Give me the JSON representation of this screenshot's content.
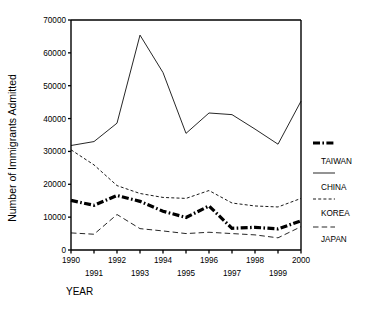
{
  "figure": {
    "clipped_title": "",
    "background": "#ffffff",
    "ink_color": "#000000"
  },
  "axis_x_title": "YEAR",
  "axis_y_title": "Number of Immigrants Admitted",
  "legend": {
    "entries": [
      {
        "label": "TAIWAN",
        "style": "thick-dash-dot",
        "series": "KOREA"
      },
      {
        "label": "CHINA",
        "style": "thin-solid",
        "series": "TAIWAN"
      },
      {
        "label": "KOREA",
        "style": "fine-dotted",
        "series": "CHINA"
      },
      {
        "label": "JAPAN",
        "style": "long-dashed",
        "series": "JAPAN"
      }
    ]
  },
  "chart_data": {
    "type": "line",
    "title": "",
    "xlabel": "YEAR",
    "ylabel": "Number of Immigrants Admitted",
    "x": [
      1990,
      1991,
      1992,
      1993,
      1994,
      1995,
      1996,
      1997,
      1998,
      1999,
      2000
    ],
    "xticks": [
      1990,
      1991,
      1992,
      1993,
      1994,
      1995,
      1996,
      1997,
      1998,
      1999,
      2000
    ],
    "yticks": [
      0,
      10000,
      20000,
      30000,
      40000,
      50000,
      60000,
      70000
    ],
    "xlim": [
      1990,
      2000
    ],
    "ylim": [
      0,
      70000
    ],
    "grid": false,
    "legend_position": "right",
    "series": [
      {
        "name": "TAIWAN",
        "style": "thin-solid",
        "values": [
          31800,
          33000,
          38600,
          65400,
          54000,
          35500,
          41700,
          41200,
          36800,
          32200,
          45300
        ]
      },
      {
        "name": "CHINA",
        "style": "fine-dotted",
        "values": [
          30500,
          25900,
          19600,
          17200,
          16000,
          15700,
          18100,
          14300,
          13400,
          13100,
          15700
        ]
      },
      {
        "name": "KOREA",
        "style": "thick-dash-dot",
        "values": [
          15100,
          13600,
          16600,
          14800,
          11800,
          9900,
          13400,
          6600,
          6900,
          6400,
          8900
        ]
      },
      {
        "name": "JAPAN",
        "style": "long-dashed",
        "values": [
          5200,
          4800,
          10800,
          6500,
          5800,
          5000,
          5400,
          5000,
          4600,
          3700,
          7100
        ]
      }
    ]
  }
}
